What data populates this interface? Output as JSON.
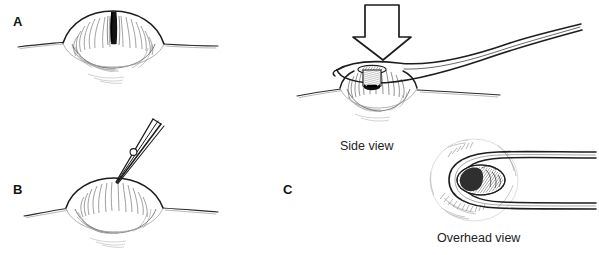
{
  "figure": {
    "background_color": "#ffffff",
    "ink_color": "#1a1a1a",
    "shade_color": "#8c8c8c",
    "width": 599,
    "height": 255
  },
  "panels": [
    {
      "id": "a",
      "letter": "A",
      "description": "Domed skin lesion with central dark punctum, side view",
      "caption": ""
    },
    {
      "id": "b",
      "letter": "B",
      "description": "Needle tip puncturing the apex of the lesion",
      "caption": ""
    },
    {
      "id": "c",
      "letter": "C",
      "description": "Comedone extractor loop pressed over the punctum",
      "caption": ""
    }
  ],
  "captions": {
    "side_view": "Side view",
    "overhead_view": "Overhead view"
  },
  "annotations": {
    "pressure_arrow": "downward-pressure-arrow"
  },
  "icons": {
    "lesion": "skin-lesion-icon",
    "punctum": "dark-punctum-icon",
    "needle": "needle-icon",
    "extractor": "comedone-extractor-icon",
    "arrow": "down-arrow-icon",
    "core": "extruded-core-icon"
  }
}
